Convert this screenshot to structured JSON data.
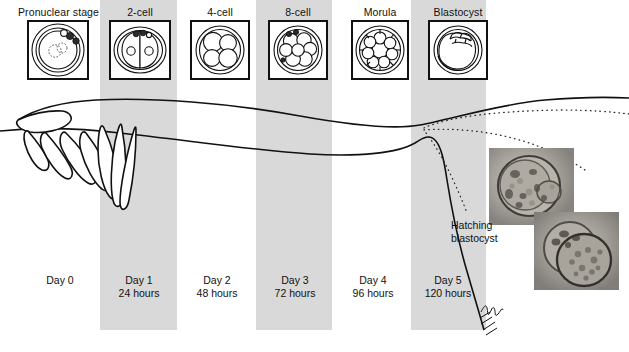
{
  "figure": {
    "width": 629,
    "height": 352,
    "background_color": "#ffffff",
    "band_color": "#d9d9d9",
    "ink_color": "#111111"
  },
  "stages": [
    {
      "label": "Pronuclear stage",
      "icon": "pronuclear-stage-embryo-icon",
      "box_x": 27,
      "box_y": 20,
      "box_w": 62,
      "box_h": 60,
      "label_x": 18,
      "label_y": 6
    },
    {
      "label": "2-cell",
      "icon": "two-cell-embryo-icon",
      "box_x": 109,
      "box_y": 20,
      "box_w": 62,
      "box_h": 60,
      "label_x": 122,
      "label_y": 6
    },
    {
      "label": "4-cell",
      "icon": "four-cell-embryo-icon",
      "box_x": 190,
      "box_y": 20,
      "box_w": 60,
      "box_h": 60,
      "label_x": 201,
      "label_y": 6
    },
    {
      "label": "8-cell",
      "icon": "eight-cell-embryo-icon",
      "box_x": 268,
      "box_y": 20,
      "box_w": 60,
      "box_h": 60,
      "label_x": 279,
      "label_y": 6
    },
    {
      "label": "Morula",
      "icon": "morula-embryo-icon",
      "box_x": 351,
      "box_y": 20,
      "box_w": 58,
      "box_h": 60,
      "label_x": 360,
      "label_y": 6
    },
    {
      "label": "Blastocyst",
      "icon": "blastocyst-embryo-icon",
      "box_x": 428,
      "box_y": 20,
      "box_w": 60,
      "box_h": 60,
      "label_x": 430,
      "label_y": 6
    }
  ],
  "bands": [
    {
      "name": "day-1-band",
      "x": 100,
      "y": 0,
      "w": 77,
      "h": 330
    },
    {
      "name": "day-3-band",
      "x": 256,
      "y": 0,
      "w": 76,
      "h": 330
    },
    {
      "name": "day-5-band",
      "x": 411,
      "y": 0,
      "w": 75,
      "h": 330
    }
  ],
  "timeline": [
    {
      "day": "Day 0",
      "hours": "",
      "x": 28,
      "y": 274
    },
    {
      "day": "Day 1",
      "hours": "24 hours",
      "x": 107,
      "y": 274
    },
    {
      "day": "Day 2",
      "hours": "48 hours",
      "x": 185,
      "y": 274
    },
    {
      "day": "Day 3",
      "hours": "72 hours",
      "x": 263,
      "y": 274
    },
    {
      "day": "Day 4",
      "hours": "96 hours",
      "x": 341,
      "y": 274
    },
    {
      "day": "Day 5",
      "hours": "120 hours",
      "x": 414,
      "y": 274
    }
  ],
  "annotations": {
    "hatching_blastocyst_line1": "Hatching",
    "hatching_blastocyst_line2": "blastocyst",
    "hatching_label_x": 451,
    "hatching_label_y": 219
  },
  "anatomy": {
    "fimbriae_icon": "fimbriae-fallopian-tube-icon",
    "oviduct_icon": "fallopian-tube-icon",
    "uterus_wall_icon": "uterine-wall-icon",
    "signature_icon": "artist-signature-icon"
  },
  "photos": [
    {
      "name": "hatching-blastocyst-photo-upper",
      "x": 489,
      "y": 148,
      "w": 85,
      "h": 77
    },
    {
      "name": "hatching-blastocyst-photo-lower",
      "x": 534,
      "y": 212,
      "w": 85,
      "h": 78
    }
  ]
}
